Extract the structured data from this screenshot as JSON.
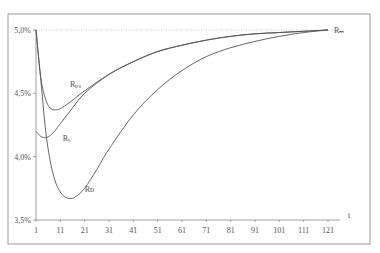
{
  "chart_data": {
    "type": "line",
    "title": "",
    "xlabel": "t",
    "ylabel": "",
    "xlim": [
      1,
      126
    ],
    "ylim": [
      3.5,
      5.0
    ],
    "x_ticks": [
      1,
      11,
      21,
      31,
      41,
      51,
      61,
      71,
      81,
      91,
      101,
      111,
      121
    ],
    "x_tick_labels": [
      "1",
      "11",
      "21",
      "31",
      "41",
      "51",
      "61",
      "71",
      "81",
      "91",
      "101",
      "111",
      "121"
    ],
    "y_ticks": [
      3.5,
      4.0,
      4.5,
      5.0
    ],
    "y_tick_labels": [
      "3,5%",
      "4,0%",
      "4,5%",
      "5,0%"
    ],
    "grid": false,
    "reference_line": {
      "y": 5.0,
      "style": "dotted"
    },
    "series": [
      {
        "name": "R_PU",
        "label": "Rₚᵤ",
        "x": [
          1,
          3,
          5,
          7,
          9,
          11,
          15,
          21,
          31,
          41,
          51,
          61,
          71,
          81,
          91,
          101,
          111,
          121
        ],
        "values": [
          5.0,
          4.62,
          4.45,
          4.38,
          4.37,
          4.38,
          4.43,
          4.52,
          4.65,
          4.75,
          4.83,
          4.88,
          4.92,
          4.95,
          4.97,
          4.98,
          4.99,
          5.0
        ]
      },
      {
        "name": "R_V",
        "label": "Rᵥ",
        "x": [
          1,
          3,
          5,
          7,
          9,
          11,
          15,
          21,
          31,
          41,
          51,
          61,
          71,
          81,
          91,
          101,
          111,
          121
        ],
        "values": [
          4.2,
          4.16,
          4.15,
          4.17,
          4.21,
          4.26,
          4.36,
          4.5,
          4.65,
          4.75,
          4.83,
          4.88,
          4.92,
          4.95,
          4.97,
          4.98,
          4.99,
          5.0
        ]
      },
      {
        "name": "R_D",
        "label": "Rᴅ",
        "x": [
          1,
          3,
          5,
          7,
          9,
          11,
          13,
          15,
          17,
          21,
          26,
          31,
          41,
          51,
          61,
          71,
          81,
          91,
          101,
          111,
          121
        ],
        "values": [
          5.0,
          4.6,
          4.2,
          3.95,
          3.8,
          3.72,
          3.68,
          3.67,
          3.68,
          3.75,
          3.9,
          4.06,
          4.33,
          4.53,
          4.68,
          4.79,
          4.86,
          4.91,
          4.95,
          4.98,
          5.0
        ]
      }
    ],
    "end_label": "Rₘ"
  }
}
